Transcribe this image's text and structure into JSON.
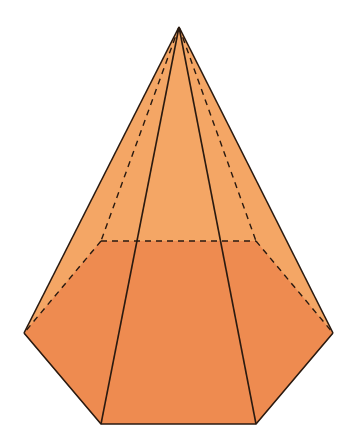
{
  "figure": {
    "colors": {
      "background": "#ffffff",
      "lateral_faces": "#F4A665",
      "base_region": "#EE8B50",
      "edge": "#2a1a10"
    },
    "vertices": {
      "apex": [
        179,
        27
      ],
      "base_left": [
        24,
        333
      ],
      "base_front_left": [
        101,
        424
      ],
      "base_front_right": [
        256,
        424
      ],
      "base_right": [
        333,
        333
      ],
      "base_back_right": [
        256,
        241
      ],
      "base_back_left": [
        101,
        241
      ]
    }
  }
}
